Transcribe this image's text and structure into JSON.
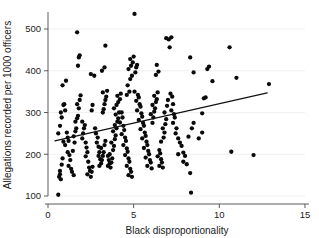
{
  "chart_data": {
    "type": "scatter",
    "title": "",
    "xlabel": "Black disproportionality",
    "ylabel": "Allegations recorded per 1000 officers",
    "xlim": [
      0,
      15
    ],
    "ylim": [
      80,
      550
    ],
    "xticks": [
      0,
      5,
      10,
      15
    ],
    "yticks": [
      100,
      200,
      300,
      400,
      500
    ],
    "xtick_labels": [
      "0",
      "5",
      "10",
      "15"
    ],
    "ytick_labels": [
      "100",
      "200",
      "300",
      "400",
      "500"
    ],
    "grid": "horizontal-faint",
    "legend": "none",
    "marker": "filled-circle",
    "marker_color": "#0a0a0a",
    "series": [
      {
        "name": "police force areas",
        "points": [
          [
            0.6,
            103
          ],
          [
            0.7,
            152
          ],
          [
            0.65,
            146
          ],
          [
            0.7,
            160
          ],
          [
            0.75,
            140
          ],
          [
            0.8,
            175
          ],
          [
            0.85,
            190
          ],
          [
            0.9,
            230
          ],
          [
            0.6,
            250
          ],
          [
            0.7,
            268
          ],
          [
            0.8,
            288
          ],
          [
            0.75,
            300
          ],
          [
            0.9,
            318
          ],
          [
            0.95,
            320
          ],
          [
            1.0,
            305
          ],
          [
            0.85,
            365
          ],
          [
            1.05,
            376
          ],
          [
            1.1,
            252
          ],
          [
            1.15,
            240
          ],
          [
            1.2,
            232
          ],
          [
            1.0,
            222
          ],
          [
            1.15,
            205
          ],
          [
            1.25,
            198
          ],
          [
            1.3,
            186
          ],
          [
            1.2,
            172
          ],
          [
            1.35,
            165
          ],
          [
            1.4,
            158
          ],
          [
            1.5,
            150
          ],
          [
            1.45,
            208
          ],
          [
            1.55,
            228
          ],
          [
            1.5,
            243
          ],
          [
            1.6,
            255
          ],
          [
            1.65,
            262
          ],
          [
            1.6,
            278
          ],
          [
            1.7,
            286
          ],
          [
            1.75,
            292
          ],
          [
            1.8,
            310
          ],
          [
            1.7,
            320
          ],
          [
            1.85,
            330
          ],
          [
            1.9,
            341
          ],
          [
            1.75,
            412
          ],
          [
            1.8,
            432
          ],
          [
            1.85,
            437
          ],
          [
            1.7,
            492
          ],
          [
            2.0,
            238
          ],
          [
            2.05,
            250
          ],
          [
            2.1,
            262
          ],
          [
            2.15,
            270
          ],
          [
            2.0,
            278
          ],
          [
            2.2,
            228
          ],
          [
            2.25,
            216
          ],
          [
            2.3,
            205
          ],
          [
            2.2,
            195
          ],
          [
            2.35,
            182
          ],
          [
            2.4,
            168
          ],
          [
            2.45,
            160
          ],
          [
            2.3,
            152
          ],
          [
            2.5,
            146
          ],
          [
            2.55,
            158
          ],
          [
            2.6,
            170
          ],
          [
            2.55,
            305
          ],
          [
            2.6,
            318
          ],
          [
            2.5,
            392
          ],
          [
            2.7,
            388
          ],
          [
            2.75,
            262
          ],
          [
            2.8,
            250
          ],
          [
            2.9,
            240
          ],
          [
            2.85,
            228
          ],
          [
            2.95,
            218
          ],
          [
            3.0,
            205
          ],
          [
            2.95,
            196
          ],
          [
            3.05,
            188
          ],
          [
            3.1,
            178
          ],
          [
            3.0,
            172
          ],
          [
            3.15,
            186
          ],
          [
            3.2,
            196
          ],
          [
            3.25,
            205
          ],
          [
            3.1,
            215
          ],
          [
            3.3,
            222
          ],
          [
            3.35,
            232
          ],
          [
            3.2,
            300
          ],
          [
            3.25,
            308
          ],
          [
            3.3,
            320
          ],
          [
            3.35,
            330
          ],
          [
            3.4,
            338
          ],
          [
            3.2,
            348
          ],
          [
            3.45,
            352
          ],
          [
            3.15,
            400
          ],
          [
            3.3,
            408
          ],
          [
            3.35,
            460
          ],
          [
            3.5,
            196
          ],
          [
            3.55,
            186
          ],
          [
            3.6,
            178
          ],
          [
            3.5,
            172
          ],
          [
            3.65,
            168
          ],
          [
            3.7,
            180
          ],
          [
            3.75,
            190
          ],
          [
            3.6,
            200
          ],
          [
            3.8,
            210
          ],
          [
            3.85,
            220
          ],
          [
            3.7,
            228
          ],
          [
            3.9,
            236
          ],
          [
            3.95,
            245
          ],
          [
            3.8,
            255
          ],
          [
            4.0,
            262
          ],
          [
            3.9,
            270
          ],
          [
            4.05,
            278
          ],
          [
            4.1,
            286
          ],
          [
            3.95,
            295
          ],
          [
            4.15,
            300
          ],
          [
            3.85,
            310
          ],
          [
            4.0,
            318
          ],
          [
            4.1,
            325
          ],
          [
            4.2,
            332
          ],
          [
            4.05,
            340
          ],
          [
            4.25,
            345
          ],
          [
            4.3,
            300
          ],
          [
            4.35,
            288
          ],
          [
            4.2,
            276
          ],
          [
            4.4,
            268
          ],
          [
            4.45,
            258
          ],
          [
            4.3,
            248
          ],
          [
            4.5,
            240
          ],
          [
            4.55,
            232
          ],
          [
            4.4,
            222
          ],
          [
            4.6,
            214
          ],
          [
            4.65,
            206
          ],
          [
            4.5,
            198
          ],
          [
            4.7,
            190
          ],
          [
            4.75,
            182
          ],
          [
            4.6,
            172
          ],
          [
            4.8,
            165
          ],
          [
            4.85,
            158
          ],
          [
            4.7,
            150
          ],
          [
            4.9,
            146
          ],
          [
            4.6,
            342
          ],
          [
            4.75,
            350
          ],
          [
            4.65,
            365
          ],
          [
            4.8,
            380
          ],
          [
            4.9,
            388
          ],
          [
            4.7,
            404
          ],
          [
            4.85,
            412
          ],
          [
            4.95,
            420
          ],
          [
            4.8,
            428
          ],
          [
            5.0,
            434
          ],
          [
            5.05,
            536
          ],
          [
            5.1,
            396
          ],
          [
            5.15,
            408
          ],
          [
            5.2,
            414
          ],
          [
            5.05,
            350
          ],
          [
            5.25,
            342
          ],
          [
            5.3,
            336
          ],
          [
            5.15,
            328
          ],
          [
            5.35,
            320
          ],
          [
            5.4,
            314
          ],
          [
            5.2,
            305
          ],
          [
            5.45,
            298
          ],
          [
            5.5,
            290
          ],
          [
            5.3,
            282
          ],
          [
            5.55,
            275
          ],
          [
            5.6,
            268
          ],
          [
            5.4,
            260
          ],
          [
            5.65,
            252
          ],
          [
            5.7,
            244
          ],
          [
            5.5,
            238
          ],
          [
            5.75,
            230
          ],
          [
            5.8,
            222
          ],
          [
            5.6,
            215
          ],
          [
            5.85,
            208
          ],
          [
            5.9,
            200
          ],
          [
            5.7,
            192
          ],
          [
            5.95,
            186
          ],
          [
            6.0,
            180
          ],
          [
            5.8,
            172
          ],
          [
            6.05,
            166
          ],
          [
            6.1,
            275
          ],
          [
            6.15,
            288
          ],
          [
            6.0,
            296
          ],
          [
            6.2,
            302
          ],
          [
            6.25,
            310
          ],
          [
            6.1,
            318
          ],
          [
            6.3,
            325
          ],
          [
            6.35,
            332
          ],
          [
            6.2,
            340
          ],
          [
            6.4,
            348
          ],
          [
            6.3,
            390
          ],
          [
            6.45,
            398
          ],
          [
            6.35,
            414
          ],
          [
            6.5,
            210
          ],
          [
            6.55,
            202
          ],
          [
            6.4,
            195
          ],
          [
            6.6,
            188
          ],
          [
            6.65,
            180
          ],
          [
            6.5,
            172
          ],
          [
            6.7,
            168
          ],
          [
            6.6,
            230
          ],
          [
            6.75,
            240
          ],
          [
            6.8,
            252
          ],
          [
            6.7,
            262
          ],
          [
            6.85,
            272
          ],
          [
            6.9,
            284
          ],
          [
            6.8,
            300
          ],
          [
            6.95,
            316
          ],
          [
            7.0,
            330
          ],
          [
            6.9,
            478
          ],
          [
            7.05,
            475
          ],
          [
            7.2,
            480
          ],
          [
            7.1,
            456
          ],
          [
            7.15,
            345
          ],
          [
            7.25,
            338
          ],
          [
            7.3,
            320
          ],
          [
            7.2,
            305
          ],
          [
            7.35,
            296
          ],
          [
            7.4,
            288
          ],
          [
            7.3,
            275
          ],
          [
            7.5,
            262
          ],
          [
            7.45,
            250
          ],
          [
            7.6,
            238
          ],
          [
            7.7,
            228
          ],
          [
            7.8,
            220
          ],
          [
            7.6,
            200
          ],
          [
            7.9,
            204
          ],
          [
            8.0,
            196
          ],
          [
            7.9,
            182
          ],
          [
            8.1,
            176
          ],
          [
            8.3,
            155
          ],
          [
            8.35,
            108
          ],
          [
            8.2,
            242
          ],
          [
            8.4,
            262
          ],
          [
            8.5,
            275
          ],
          [
            8.3,
            432
          ],
          [
            8.5,
            396
          ],
          [
            8.8,
            238
          ],
          [
            9.0,
            298
          ],
          [
            9.1,
            334
          ],
          [
            9.2,
            336
          ],
          [
            9.3,
            404
          ],
          [
            9.4,
            410
          ],
          [
            9.0,
            252
          ],
          [
            9.6,
            375
          ],
          [
            10.6,
            456
          ],
          [
            10.7,
            206
          ],
          [
            11.0,
            383
          ],
          [
            12.0,
            198
          ],
          [
            12.9,
            368
          ]
        ]
      }
    ],
    "fit_line": {
      "name": "linear fit",
      "x_start": 0.4,
      "y_start": 232,
      "x_end": 12.8,
      "y_end": 347,
      "color": "#111111"
    }
  }
}
